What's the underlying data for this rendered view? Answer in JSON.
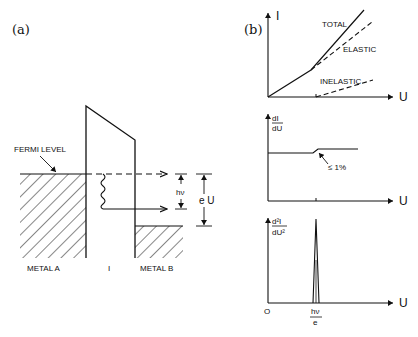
{
  "panel_a": {
    "label": "(a)",
    "fermi_level": "FERMI LEVEL",
    "photon_energy": "hν",
    "bias_energy": "e U",
    "metal_a": "METAL A",
    "insulator": "I",
    "metal_b": "METAL B"
  },
  "panel_b": {
    "label": "(b)",
    "top_chart": {
      "y_axis": "I",
      "x_axis": "U",
      "curves": [
        "TOTAL",
        "ELASTIC",
        "INELASTIC"
      ]
    },
    "middle_chart": {
      "y_axis_num": "dI",
      "y_axis_den": "dU",
      "x_axis": "U",
      "annotation": "≤ 1%"
    },
    "bottom_chart": {
      "y_axis_num": "d²I",
      "y_axis_den": "dU²",
      "x_axis": "U",
      "origin": "O",
      "peak_num": "hν",
      "peak_den": "e"
    }
  },
  "colors": {
    "ink": "#111111",
    "background": "#ffffff"
  }
}
